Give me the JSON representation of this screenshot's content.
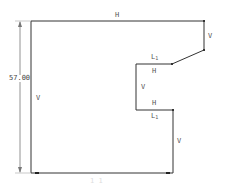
{
  "diagram": {
    "type": "cad-constraint-profile",
    "stroke_color": "#333333",
    "dimension_color": "#666666",
    "dimensions": {
      "height": "57.00",
      "width": "1 1"
    },
    "constraint_labels": {
      "top": "H",
      "right_upper": "V",
      "chamfer_top": "L",
      "chamfer_top_sub": "1",
      "notch_top": "H",
      "notch_left": "V",
      "notch_bottom": "H",
      "notch_bottom_len": "L",
      "notch_bottom_len_sub": "1",
      "right_lower": "V",
      "left": "V"
    }
  }
}
